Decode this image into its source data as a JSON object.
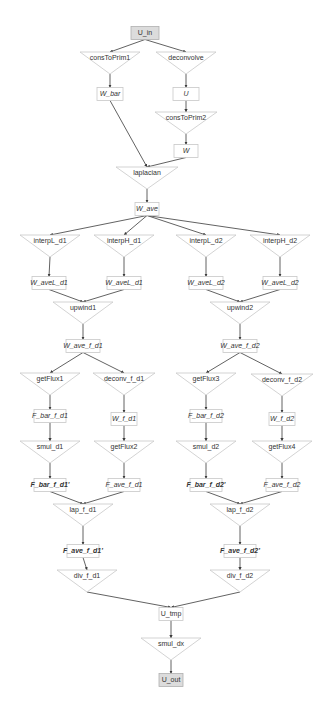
{
  "diagram": {
    "colors": {
      "edge": "#3a3a3a",
      "node_border": "#c8c8c8",
      "io_fill": "#dcdcdc",
      "text": "#333333"
    },
    "nodes": [
      {
        "id": "U_in",
        "label": "U_in",
        "kind": "io",
        "x": 145,
        "y": 33,
        "w": 28
      },
      {
        "id": "consToPrim1",
        "label": "consToPrim1",
        "kind": "op",
        "x": 110,
        "y": 60,
        "w": 60
      },
      {
        "id": "deconvolve",
        "label": "deconvolve",
        "kind": "op",
        "x": 186,
        "y": 60,
        "w": 60
      },
      {
        "id": "W_bar",
        "label": "W_bar",
        "kind": "data",
        "x": 110,
        "y": 94,
        "w": 26
      },
      {
        "id": "U",
        "label": "U",
        "kind": "data",
        "x": 186,
        "y": 94,
        "w": 26
      },
      {
        "id": "consToPrim2",
        "label": "consToPrim2",
        "kind": "op",
        "x": 186,
        "y": 120,
        "w": 62
      },
      {
        "id": "W",
        "label": "W",
        "kind": "data",
        "x": 186,
        "y": 151,
        "w": 24
      },
      {
        "id": "laplacian",
        "label": "laplacian",
        "kind": "op",
        "x": 147,
        "y": 175,
        "w": 62
      },
      {
        "id": "W_ave",
        "label": "W_ave",
        "kind": "data",
        "x": 147,
        "y": 209,
        "w": 24
      },
      {
        "id": "interpL_d1",
        "label": "interpL_d1",
        "kind": "op",
        "x": 50,
        "y": 243,
        "w": 60
      },
      {
        "id": "interpH_d1",
        "label": "interpH_d1",
        "kind": "op",
        "x": 124,
        "y": 243,
        "w": 60
      },
      {
        "id": "interpL_d2",
        "label": "interpL_d2",
        "kind": "op",
        "x": 206,
        "y": 243,
        "w": 60
      },
      {
        "id": "interpH_d2",
        "label": "interpH_d2",
        "kind": "op",
        "x": 280,
        "y": 243,
        "w": 60
      },
      {
        "id": "W_aveL_d1a",
        "label": "W_aveL_d1",
        "kind": "data",
        "x": 49,
        "y": 283,
        "w": 34
      },
      {
        "id": "W_aveL_d1b",
        "label": "W_aveL_d1",
        "kind": "data",
        "x": 124,
        "y": 283,
        "w": 34
      },
      {
        "id": "W_aveL_d2a",
        "label": "W_aveL_d2",
        "kind": "data",
        "x": 206,
        "y": 283,
        "w": 34
      },
      {
        "id": "W_aveL_d2b",
        "label": "W_aveL_d2",
        "kind": "data",
        "x": 280,
        "y": 283,
        "w": 34
      },
      {
        "id": "upwind1",
        "label": "upwind1",
        "kind": "op",
        "x": 83,
        "y": 310,
        "w": 60
      },
      {
        "id": "upwind2",
        "label": "upwind2",
        "kind": "op",
        "x": 240,
        "y": 310,
        "w": 60
      },
      {
        "id": "W_ave_f_d1",
        "label": "W_ave_f_d1",
        "kind": "data",
        "x": 83,
        "y": 346,
        "w": 34
      },
      {
        "id": "W_ave_f_d2",
        "label": "W_ave_f_d2",
        "kind": "data",
        "x": 240,
        "y": 346,
        "w": 34
      },
      {
        "id": "getFlux1",
        "label": "getFlux1",
        "kind": "op",
        "x": 50,
        "y": 381,
        "w": 60
      },
      {
        "id": "deconv_f_d1",
        "label": "deconv_f_d1",
        "kind": "op",
        "x": 124,
        "y": 381,
        "w": 62
      },
      {
        "id": "getFlux3",
        "label": "getFlux3",
        "kind": "op",
        "x": 206,
        "y": 381,
        "w": 60
      },
      {
        "id": "deconv_f_d2",
        "label": "deconv_f_d2",
        "kind": "op",
        "x": 282,
        "y": 382,
        "w": 62
      },
      {
        "id": "F_bar_f_d1",
        "label": "F_bar_f_d1",
        "kind": "data",
        "x": 50,
        "y": 416,
        "w": 32
      },
      {
        "id": "W_f_d1",
        "label": "W_f_d1",
        "kind": "data",
        "x": 124,
        "y": 419,
        "w": 26
      },
      {
        "id": "F_bar_f_d2",
        "label": "F_bar_f_d2",
        "kind": "data",
        "x": 206,
        "y": 416,
        "w": 32
      },
      {
        "id": "W_f_d2",
        "label": "W_f_d2",
        "kind": "data",
        "x": 282,
        "y": 419,
        "w": 26
      },
      {
        "id": "smul_d1",
        "label": "smul_d1",
        "kind": "op",
        "x": 50,
        "y": 449,
        "w": 60
      },
      {
        "id": "getFlux2",
        "label": "getFlux2",
        "kind": "op",
        "x": 124,
        "y": 449,
        "w": 60
      },
      {
        "id": "smul_d2",
        "label": "smul_d2",
        "kind": "op",
        "x": 206,
        "y": 449,
        "w": 60
      },
      {
        "id": "getFlux4",
        "label": "getFlux4",
        "kind": "op",
        "x": 282,
        "y": 449,
        "w": 60
      },
      {
        "id": "F_bar_f_d1p",
        "label": "F_bar_f_d1'",
        "kind": "data-bold",
        "x": 50,
        "y": 485,
        "w": 32
      },
      {
        "id": "F_ave_f_d1",
        "label": "F_ave_f_d1",
        "kind": "data",
        "x": 124,
        "y": 485,
        "w": 32
      },
      {
        "id": "F_bar_f_d2p",
        "label": "F_bar_f_d2'",
        "kind": "data-bold",
        "x": 206,
        "y": 485,
        "w": 32
      },
      {
        "id": "F_ave_f_d2",
        "label": "F_ave_f_d2",
        "kind": "data",
        "x": 282,
        "y": 485,
        "w": 32
      },
      {
        "id": "lap_f_d1",
        "label": "lap_f_d1",
        "kind": "op",
        "x": 83,
        "y": 512,
        "w": 60
      },
      {
        "id": "lap_f_d2",
        "label": "lap_f_d2",
        "kind": "op",
        "x": 240,
        "y": 512,
        "w": 60
      },
      {
        "id": "F_ave_f_d1p",
        "label": "F_ave_f_d1'",
        "kind": "data-bold",
        "x": 83,
        "y": 551,
        "w": 32
      },
      {
        "id": "F_ave_f_d2p",
        "label": "F_ave_f_d2'",
        "kind": "data-bold",
        "x": 240,
        "y": 551,
        "w": 32
      },
      {
        "id": "div_f_d1",
        "label": "div_f_d1",
        "kind": "op",
        "x": 87,
        "y": 578,
        "w": 60
      },
      {
        "id": "div_f_d2",
        "label": "div_f_d2",
        "kind": "op",
        "x": 240,
        "y": 578,
        "w": 60
      },
      {
        "id": "U_tmp",
        "label": "U_tmp",
        "kind": "data-plain",
        "x": 171,
        "y": 614,
        "w": 24
      },
      {
        "id": "smul_dx",
        "label": "smul_dx",
        "kind": "op",
        "x": 171,
        "y": 646,
        "w": 60
      },
      {
        "id": "U_out",
        "label": "U_out",
        "kind": "io",
        "x": 171,
        "y": 680,
        "w": 24
      }
    ],
    "edges": [
      [
        "U_in",
        "consToPrim1"
      ],
      [
        "U_in",
        "deconvolve"
      ],
      [
        "consToPrim1",
        "W_bar"
      ],
      [
        "deconvolve",
        "U"
      ],
      [
        "U",
        "consToPrim2"
      ],
      [
        "consToPrim2",
        "W"
      ],
      [
        "W_bar",
        "laplacian"
      ],
      [
        "W",
        "laplacian"
      ],
      [
        "laplacian",
        "W_ave"
      ],
      [
        "W_ave",
        "interpL_d1"
      ],
      [
        "W_ave",
        "interpH_d1"
      ],
      [
        "W_ave",
        "interpL_d2"
      ],
      [
        "W_ave",
        "interpH_d2"
      ],
      [
        "interpL_d1",
        "W_aveL_d1a"
      ],
      [
        "interpH_d1",
        "W_aveL_d1b"
      ],
      [
        "interpL_d2",
        "W_aveL_d2a"
      ],
      [
        "interpH_d2",
        "W_aveL_d2b"
      ],
      [
        "W_aveL_d1a",
        "upwind1"
      ],
      [
        "W_aveL_d1b",
        "upwind1"
      ],
      [
        "W_aveL_d2a",
        "upwind2"
      ],
      [
        "W_aveL_d2b",
        "upwind2"
      ],
      [
        "upwind1",
        "W_ave_f_d1"
      ],
      [
        "upwind2",
        "W_ave_f_d2"
      ],
      [
        "W_ave_f_d1",
        "getFlux1"
      ],
      [
        "W_ave_f_d1",
        "deconv_f_d1"
      ],
      [
        "W_ave_f_d2",
        "getFlux3"
      ],
      [
        "W_ave_f_d2",
        "deconv_f_d2"
      ],
      [
        "getFlux1",
        "F_bar_f_d1"
      ],
      [
        "deconv_f_d1",
        "W_f_d1"
      ],
      [
        "getFlux3",
        "F_bar_f_d2"
      ],
      [
        "deconv_f_d2",
        "W_f_d2"
      ],
      [
        "F_bar_f_d1",
        "smul_d1"
      ],
      [
        "W_f_d1",
        "getFlux2"
      ],
      [
        "F_bar_f_d2",
        "smul_d2"
      ],
      [
        "W_f_d2",
        "getFlux4"
      ],
      [
        "smul_d1",
        "F_bar_f_d1p"
      ],
      [
        "getFlux2",
        "F_ave_f_d1"
      ],
      [
        "smul_d2",
        "F_bar_f_d2p"
      ],
      [
        "getFlux4",
        "F_ave_f_d2"
      ],
      [
        "F_bar_f_d1p",
        "lap_f_d1"
      ],
      [
        "F_ave_f_d1",
        "lap_f_d1"
      ],
      [
        "F_bar_f_d2p",
        "lap_f_d2"
      ],
      [
        "F_ave_f_d2",
        "lap_f_d2"
      ],
      [
        "lap_f_d1",
        "F_ave_f_d1p"
      ],
      [
        "lap_f_d2",
        "F_ave_f_d2p"
      ],
      [
        "F_ave_f_d1p",
        "div_f_d1"
      ],
      [
        "F_ave_f_d2p",
        "div_f_d2"
      ],
      [
        "div_f_d1",
        "U_tmp"
      ],
      [
        "div_f_d2",
        "U_tmp"
      ],
      [
        "U_tmp",
        "smul_dx"
      ],
      [
        "smul_dx",
        "U_out"
      ]
    ]
  }
}
